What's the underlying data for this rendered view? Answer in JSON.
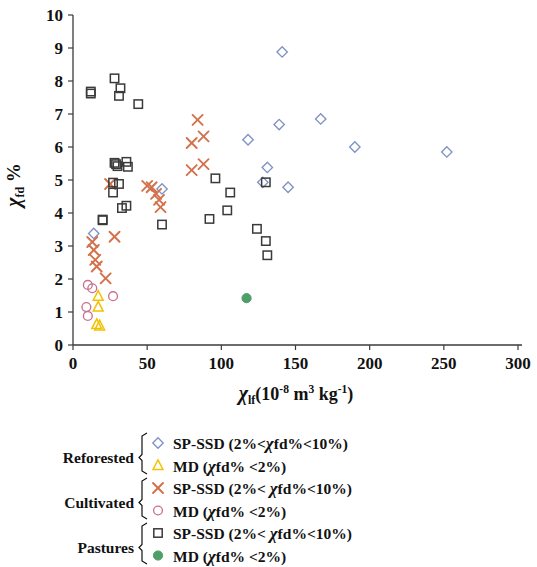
{
  "chart_data": {
    "type": "scatter",
    "title": "",
    "xlabel": "χlf (10-8 m3 kg-1)",
    "ylabel": "χfd %",
    "xlim": [
      0,
      300
    ],
    "ylim": [
      0,
      10
    ],
    "xticks": [
      0,
      50,
      100,
      150,
      200,
      250,
      300
    ],
    "yticks": [
      0,
      1,
      2,
      3,
      4,
      5,
      6,
      7,
      8,
      9,
      10
    ],
    "grid": false,
    "legend_position": "below-plot",
    "series": [
      {
        "name": "Reforested SP-SSD (2%<χfd%<10%)",
        "group": "Reforested",
        "marker": "open-diamond",
        "color": "#8091c4",
        "points": [
          [
            14,
            3.38
          ],
          [
            118,
            6.22
          ],
          [
            128,
            4.93
          ],
          [
            131,
            5.38
          ],
          [
            141,
            8.88
          ],
          [
            139,
            6.68
          ],
          [
            145,
            4.78
          ],
          [
            167,
            6.85
          ],
          [
            190,
            6.0
          ],
          [
            252,
            5.85
          ],
          [
            60,
            4.73
          ]
        ]
      },
      {
        "name": "Reforested MD (χfd% <2%)",
        "group": "Reforested",
        "marker": "open-triangle",
        "color": "#f2c200",
        "points": [
          [
            17,
            1.48
          ],
          [
            17,
            1.15
          ],
          [
            16,
            0.62
          ],
          [
            18,
            0.58
          ]
        ]
      },
      {
        "name": "Cultivated SP-SSD (2%<χfd%<10%)",
        "group": "Cultivated",
        "marker": "cross",
        "color": "#d4704a",
        "points": [
          [
            13,
            3.12
          ],
          [
            14,
            2.88
          ],
          [
            15,
            2.58
          ],
          [
            16,
            2.38
          ],
          [
            22,
            2.02
          ],
          [
            28,
            3.28
          ],
          [
            50,
            4.82
          ],
          [
            53,
            4.78
          ],
          [
            56,
            4.58
          ],
          [
            58,
            4.4
          ],
          [
            59,
            4.18
          ],
          [
            80,
            6.12
          ],
          [
            84,
            6.82
          ],
          [
            88,
            6.32
          ],
          [
            80,
            5.3
          ],
          [
            88,
            5.48
          ],
          [
            25,
            4.88
          ]
        ]
      },
      {
        "name": "Cultivated MD (χfd% <2%)",
        "group": "Cultivated",
        "marker": "open-circle",
        "color": "#c9708f",
        "points": [
          [
            10,
            1.82
          ],
          [
            13,
            1.72
          ],
          [
            9,
            1.15
          ],
          [
            10,
            0.88
          ],
          [
            27,
            1.48
          ]
        ]
      },
      {
        "name": "Pastures SP-SSD (2%<χfd%<10%)",
        "group": "Pastures",
        "marker": "open-square",
        "color": "#3a3a3a",
        "points": [
          [
            12,
            7.62
          ],
          [
            12,
            7.68
          ],
          [
            28,
            8.08
          ],
          [
            32,
            7.78
          ],
          [
            31,
            7.55
          ],
          [
            44,
            7.3
          ],
          [
            28,
            5.52
          ],
          [
            29,
            5.48
          ],
          [
            30,
            5.42
          ],
          [
            36,
            5.55
          ],
          [
            37,
            5.4
          ],
          [
            27,
            4.92
          ],
          [
            31,
            4.88
          ],
          [
            27,
            4.62
          ],
          [
            36,
            4.22
          ],
          [
            33,
            4.15
          ],
          [
            20,
            3.78
          ],
          [
            20,
            3.8
          ],
          [
            60,
            3.65
          ],
          [
            96,
            5.05
          ],
          [
            106,
            4.62
          ],
          [
            104,
            4.08
          ],
          [
            92,
            3.82
          ],
          [
            124,
            3.52
          ],
          [
            130,
            3.15
          ],
          [
            131,
            2.72
          ],
          [
            130,
            4.93
          ]
        ]
      },
      {
        "name": "Pastures MD (χfd% <2%)",
        "group": "Pastures",
        "marker": "filled-circle",
        "color": "#4e9e6a",
        "points": [
          [
            117,
            1.42
          ]
        ]
      }
    ]
  },
  "axes": {
    "y_title": "χfd %",
    "x_title_chi": "χ",
    "x_title_sub": "lf",
    "x_title_rest": "(10",
    "x_exp1": "-8",
    "x_unit_m": " m",
    "x_exp2": "3",
    "x_unit_kg": " kg",
    "x_exp3": "-1",
    "x_close": ")"
  },
  "legend": {
    "groups": [
      {
        "name": "Reforested",
        "entries": [
          {
            "marker": "open-diamond",
            "color": "#8091c4",
            "label_pre": "SP-SSD (2%<",
            "chi": "χ",
            "label_post": "fd%<10%)"
          },
          {
            "marker": "open-triangle",
            "color": "#f2c200",
            "label_pre": "MD (",
            "chi": "χ",
            "label_post": "fd% <2%)"
          }
        ]
      },
      {
        "name": "Cultivated",
        "entries": [
          {
            "marker": "cross",
            "color": "#d4704a",
            "label_pre": "SP-SSD (2%< ",
            "chi": "χ",
            "label_post": "fd%<10%)"
          },
          {
            "marker": "open-circle",
            "color": "#c9708f",
            "label_pre": "MD (",
            "chi": "χ",
            "label_post": "fd% <2%)"
          }
        ]
      },
      {
        "name": "Pastures",
        "entries": [
          {
            "marker": "open-square",
            "color": "#3a3a3a",
            "label_pre": "SP-SSD (2%< ",
            "chi": "χ",
            "label_post": "fd%<10%)"
          },
          {
            "marker": "filled-circle",
            "color": "#4e9e6a",
            "label_pre": "MD (",
            "chi": "χ",
            "label_post": "fd% <2%)"
          }
        ]
      }
    ]
  }
}
